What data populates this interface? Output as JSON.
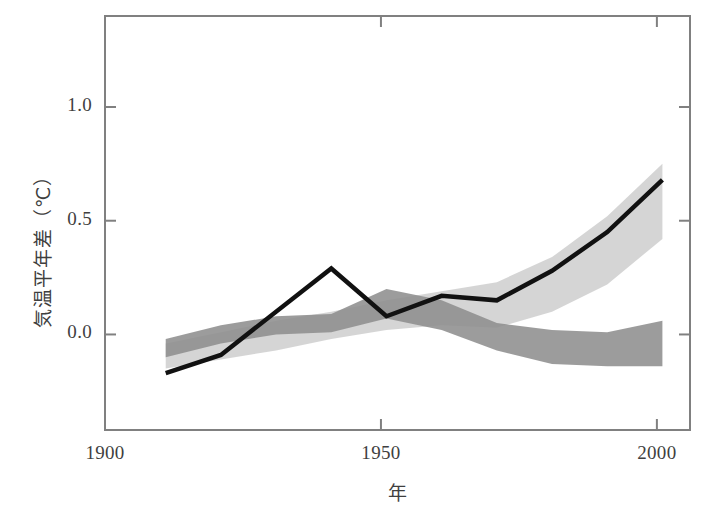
{
  "chart_data": {
    "type": "line",
    "title": "",
    "xlabel": "年",
    "ylabel": "気温平年差（℃）",
    "xlim": [
      1900,
      2006
    ],
    "ylim": [
      -0.42,
      1.4
    ],
    "grid": false,
    "legend_position": "none",
    "xticks": [
      1900,
      1950,
      2000
    ],
    "xtick_labels": [
      "1900",
      "1950",
      "2000"
    ],
    "yticks": [
      0.0,
      0.5,
      1.0
    ],
    "ytick_labels": [
      "0.0",
      "0.5",
      "1.0"
    ],
    "series": [
      {
        "name": "観測された気温",
        "kind": "line",
        "color": "#111111",
        "linewidth": 4.5,
        "x": [
          1911,
          1921,
          1941,
          1951,
          1961,
          1971,
          1981,
          1991,
          2001
        ],
        "values": [
          -0.17,
          -0.09,
          0.29,
          0.08,
          0.17,
          0.15,
          0.28,
          0.45,
          0.68
        ]
      },
      {
        "name": "自然起源＋人為起源の強制力による再現（範囲）",
        "kind": "band",
        "color": "#cfcfcf",
        "x": [
          1911,
          1921,
          1931,
          1941,
          1951,
          1961,
          1971,
          1981,
          1991,
          2001
        ],
        "upper": [
          -0.04,
          0.01,
          0.06,
          0.1,
          0.15,
          0.19,
          0.23,
          0.34,
          0.52,
          0.75
        ],
        "lower": [
          -0.15,
          -0.11,
          -0.07,
          -0.02,
          0.02,
          0.04,
          0.03,
          0.1,
          0.22,
          0.42
        ]
      },
      {
        "name": "自然起源の強制力のみによる再現（範囲）",
        "kind": "band",
        "color": "#8e8e8e",
        "x": [
          1911,
          1921,
          1931,
          1941,
          1951,
          1961,
          1971,
          1981,
          1991,
          2001
        ],
        "upper": [
          -0.02,
          0.04,
          0.08,
          0.09,
          0.2,
          0.15,
          0.05,
          0.02,
          0.01,
          0.06
        ],
        "lower": [
          -0.1,
          -0.04,
          0.0,
          0.01,
          0.07,
          0.02,
          -0.07,
          -0.13,
          -0.14,
          -0.14
        ]
      }
    ]
  },
  "axes": {
    "frame_color": "#808080",
    "background": "#ffffff"
  }
}
